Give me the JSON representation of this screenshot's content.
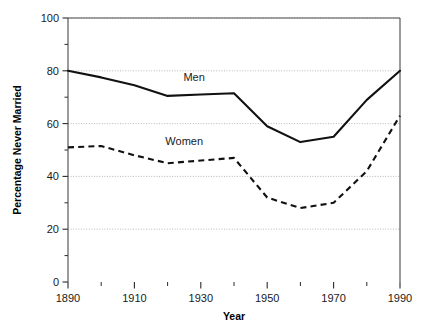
{
  "chart_data": {
    "type": "line",
    "title": "",
    "xlabel": "Year",
    "ylabel": "Percentage Never Married",
    "xlim": [
      1890,
      1990
    ],
    "ylim": [
      0,
      100
    ],
    "grid": true,
    "legend_position": "inline-annotation",
    "x": [
      1890,
      1900,
      1910,
      1920,
      1930,
      1940,
      1950,
      1960,
      1970,
      1980,
      1990
    ],
    "xticks": [
      1890,
      1910,
      1930,
      1950,
      1970,
      1990
    ],
    "xticklabels": [
      "1890",
      "1910",
      "1930",
      "1950",
      "1970",
      "1990"
    ],
    "xminorticks": [
      1900,
      1920,
      1940,
      1960,
      1980
    ],
    "yticks": [
      0,
      20,
      40,
      60,
      80,
      100
    ],
    "yticklabels": [
      "0",
      "20",
      "40",
      "60",
      "80",
      "100"
    ],
    "yminorticks": [
      10,
      30,
      50,
      70,
      90
    ],
    "series": [
      {
        "name": "Men",
        "style": "solid",
        "color": "#111111",
        "label_x": 1928,
        "label_y": 76,
        "values": [
          80,
          77.5,
          74.5,
          70.5,
          71,
          71.5,
          59,
          53,
          55,
          69,
          80
        ]
      },
      {
        "name": "Women",
        "style": "dashed",
        "color": "#111111",
        "label_x": 1925,
        "label_y": 52,
        "values": [
          51,
          51.5,
          48,
          45,
          46,
          47,
          32,
          28,
          30,
          42,
          63
        ]
      }
    ]
  }
}
